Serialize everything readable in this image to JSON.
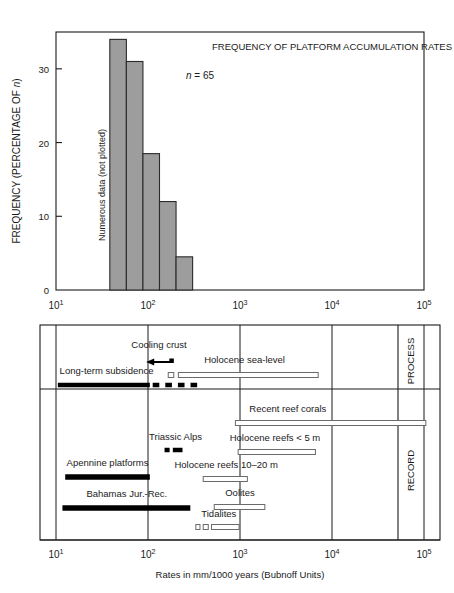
{
  "figure": {
    "axis_label": "Rates in mm/1000 years (Bubnoff Units)",
    "decade_ticks": [
      "10",
      "10",
      "10",
      "10",
      "10"
    ],
    "decade_exponents": [
      "1",
      "2",
      "3",
      "4",
      "5"
    ]
  },
  "chart_data": [
    {
      "type": "bar",
      "title": "FREQUENCY OF PLATFORM ACCUMULATION RATES",
      "annotation_n": "n = 65",
      "side_note": "Numerous data (not plotted)",
      "ylabel": "FREQUENCY (PERCENTAGE OF n)",
      "xlabel": "",
      "ylim": [
        0,
        35
      ],
      "yticks": [
        "0",
        "10",
        "20",
        "30"
      ],
      "ytick_values": [
        0,
        10,
        20,
        30
      ],
      "xlim_log": [
        1,
        5
      ],
      "xtick_labels": [
        "10¹",
        "10²",
        "10³",
        "10⁴",
        "10⁵"
      ],
      "grid": false,
      "bin_edges_log": [
        1.585,
        1.765,
        1.945,
        2.125,
        2.305,
        2.485
      ],
      "categories": [
        "38-58",
        "58-89",
        "89-133",
        "133-202",
        "202-306"
      ],
      "values": [
        34,
        31,
        18.5,
        12,
        4.5
      ]
    },
    {
      "type": "table",
      "title": "",
      "xlabel": "Rates in mm/1000 years (Bubnoff Units)",
      "xlim_log": [
        1,
        5
      ],
      "sections": [
        {
          "name": "PROCESS",
          "label": "PROCESS",
          "items": [
            {
              "label": "Cooling crust",
              "style": "arrow-left",
              "start_log": 1.98,
              "end_log": 2.27,
              "label_x_log": 2.12,
              "label_anchor": "middle"
            },
            {
              "label": "Holocene sea-level",
              "style": "open-bar-with-dot",
              "start_log": 2.22,
              "end_log": 3.85,
              "dot_start_log": 2.22,
              "dot_end_log": 2.28,
              "bar_start_log": 2.33,
              "label_x_log": 3.05,
              "label_anchor": "middle"
            },
            {
              "label": "Long-term subsidence",
              "style": "solid-then-dashed",
              "start_log": 1.02,
              "solid_end_log": 2.02,
              "end_log": 2.5,
              "label_x_log": 1.55,
              "label_anchor": "middle"
            }
          ]
        },
        {
          "name": "RECORD",
          "label": "RECORD",
          "items": [
            {
              "label": "Recent reef corals",
              "style": "open-bar",
              "start_log": 2.95,
              "end_log": 5.02,
              "label_x_log": 3.52,
              "label_anchor": "middle"
            },
            {
              "label": "Triassic Alps",
              "style": "solid-dashes",
              "segments": [
                [
                  2.18,
                  2.235
                ],
                [
                  2.27,
                  2.375
                ]
              ],
              "label_x_log": 2.3,
              "label_anchor": "middle"
            },
            {
              "label": "Holocene reefs < 5 m",
              "style": "open-bar",
              "start_log": 2.98,
              "end_log": 3.82,
              "label_x_log": 3.38,
              "label_anchor": "middle"
            },
            {
              "label": "Apennine platforms",
              "style": "solid-bar",
              "start_log": 1.1,
              "end_log": 2.02,
              "label_x_log": 1.56,
              "label_anchor": "middle"
            },
            {
              "label": "Holocene reefs 10–20 m",
              "style": "open-bar",
              "start_log": 2.6,
              "end_log": 3.08,
              "label_x_log": 2.85,
              "label_anchor": "middle"
            },
            {
              "label": "Bahamas Jur.-Rec.",
              "style": "solid-bar",
              "start_log": 1.07,
              "end_log": 2.46,
              "label_x_log": 1.77,
              "label_anchor": "middle"
            },
            {
              "label": "Oolites",
              "style": "open-bar",
              "start_log": 2.72,
              "end_log": 3.27,
              "label_x_log": 3.0,
              "label_anchor": "middle"
            },
            {
              "label": "Tidalites",
              "style": "open-dashes",
              "segments": [
                [
                  2.52,
                  2.565
                ],
                [
                  2.6,
                  2.655
                ],
                [
                  2.69,
                  2.99
                ]
              ],
              "label_x_log": 2.77,
              "label_anchor": "middle"
            }
          ]
        }
      ]
    }
  ],
  "colors": {
    "bar_fill": "#9d9d9d",
    "bar_stroke": "#2b2b2b",
    "axis": "#1a1a1a",
    "text": "#1a1a1a",
    "open_bar_stroke": "#6b6b6b",
    "solid_bar": "#000000"
  }
}
